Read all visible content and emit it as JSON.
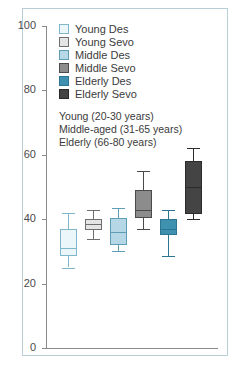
{
  "chart_data": {
    "type": "box",
    "title": "",
    "xlabel": "",
    "ylabel": "",
    "ylim": [
      0,
      100
    ],
    "yticks": [
      0,
      20,
      40,
      60,
      80,
      100
    ],
    "grid": false,
    "legend_position": "top-left",
    "categories": [
      "Young Des",
      "Young Sevo",
      "Middle Des",
      "Middle Sevo",
      "Elderly Des",
      "Elderly Sevo"
    ],
    "boxes": [
      {
        "name": "Young Des",
        "fill": "#eaf6fa",
        "stroke": "#7fb6c9",
        "whisker_high": 42.0,
        "q3": 37.0,
        "median": 31.0,
        "q1": 28.5,
        "whisker_low": 25.0
      },
      {
        "name": "Young Sevo",
        "fill": "#e4e4e4",
        "stroke": "#6f6f6f",
        "whisker_high": 43.0,
        "q3": 40.0,
        "median": 38.5,
        "q1": 36.5,
        "whisker_low": 34.0
      },
      {
        "name": "Middle Des",
        "fill": "#b6d8e6",
        "stroke": "#5e9db4",
        "whisker_high": 43.5,
        "q3": 40.5,
        "median": 36.0,
        "q1": 32.0,
        "whisker_low": 30.0
      },
      {
        "name": "Middle Sevo",
        "fill": "#8c8c8c",
        "stroke": "#4a4a4a",
        "whisker_high": 55.0,
        "q3": 49.0,
        "median": 43.0,
        "q1": 40.5,
        "whisker_low": 37.0
      },
      {
        "name": "Elderly Des",
        "fill": "#3e92b0",
        "stroke": "#2d7490",
        "whisker_high": 43.0,
        "q3": 40.0,
        "median": 37.0,
        "q1": 35.0,
        "whisker_low": 28.5
      },
      {
        "name": "Elderly Sevo",
        "fill": "#444444",
        "stroke": "#2b2b2b",
        "whisker_high": 62.0,
        "q3": 58.0,
        "median": 50.0,
        "q1": 41.5,
        "whisker_low": 40.0
      }
    ]
  },
  "legend": {
    "items": [
      {
        "label": "Young Des",
        "fill": "#eaf6fa",
        "stroke": "#7fb6c9"
      },
      {
        "label": "Young Sevo",
        "fill": "#e4e4e4",
        "stroke": "#6f6f6f"
      },
      {
        "label": "Middle Des",
        "fill": "#b6d8e6",
        "stroke": "#5e9db4"
      },
      {
        "label": "Middle Sevo",
        "fill": "#8c8c8c",
        "stroke": "#4a4a4a"
      },
      {
        "label": "Elderly Des",
        "fill": "#3e92b0",
        "stroke": "#2d7490"
      },
      {
        "label": "Elderly Sevo",
        "fill": "#444444",
        "stroke": "#2b2b2b"
      }
    ]
  },
  "annotation": {
    "lines": [
      "Young  (20-30 years)",
      "Middle-aged  (31-65 years)",
      "Elderly  (66-80 years)"
    ]
  }
}
